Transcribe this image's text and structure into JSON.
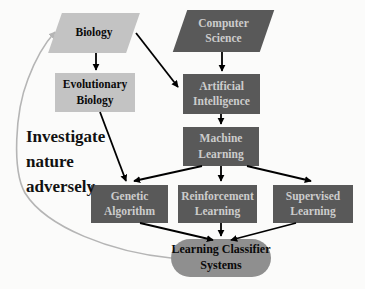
{
  "figure": {
    "type": "flowchart",
    "background": "#fbfbfa",
    "colors": {
      "light_node_fill": "#c3c3c3",
      "dark_node_fill": "#595959",
      "oval_node_fill": "#8f8f8f",
      "dark_node_text": "#cccccc",
      "light_node_text": "#0a0a0a",
      "arrow": "#000000",
      "feedback_arrow": "#b5b5b5"
    },
    "nodes": [
      {
        "id": "biology",
        "label": "Biology",
        "shape": "parallelogram",
        "variant": "light"
      },
      {
        "id": "computer-science",
        "label": "Computer Science",
        "shape": "parallelogram",
        "variant": "dark"
      },
      {
        "id": "evolutionary-biology",
        "label": "Evolutionary Biology",
        "shape": "rect",
        "variant": "light"
      },
      {
        "id": "artificial-intelligence",
        "label": "Artificial Intelligence",
        "shape": "rect",
        "variant": "dark"
      },
      {
        "id": "machine-learning",
        "label": "Machine Learning",
        "shape": "rect",
        "variant": "dark"
      },
      {
        "id": "genetic-algorithm",
        "label": "Genetic Algorithm",
        "shape": "rect",
        "variant": "dark"
      },
      {
        "id": "reinforcement-learning",
        "label": "Reinforcement Learning",
        "shape": "rect",
        "variant": "dark"
      },
      {
        "id": "supervised-learning",
        "label": "Supervised Learning",
        "shape": "rect",
        "variant": "dark"
      },
      {
        "id": "learning-classifier-systems",
        "label": "Learning Classifier Systems",
        "shape": "stadium",
        "variant": "oval"
      }
    ],
    "annotation": {
      "label": "Investigate nature adversely"
    },
    "edges": [
      {
        "from": "biology",
        "to": "evolutionary-biology",
        "style": "solid-black"
      },
      {
        "from": "biology",
        "to": "artificial-intelligence",
        "style": "solid-black"
      },
      {
        "from": "computer-science",
        "to": "artificial-intelligence",
        "style": "solid-black"
      },
      {
        "from": "artificial-intelligence",
        "to": "machine-learning",
        "style": "solid-black"
      },
      {
        "from": "evolutionary-biology",
        "to": "genetic-algorithm",
        "style": "solid-black"
      },
      {
        "from": "machine-learning",
        "to": "genetic-algorithm",
        "style": "solid-black"
      },
      {
        "from": "machine-learning",
        "to": "reinforcement-learning",
        "style": "solid-black"
      },
      {
        "from": "machine-learning",
        "to": "supervised-learning",
        "style": "solid-black"
      },
      {
        "from": "genetic-algorithm",
        "to": "learning-classifier-systems",
        "style": "solid-black"
      },
      {
        "from": "reinforcement-learning",
        "to": "learning-classifier-systems",
        "style": "solid-black"
      },
      {
        "from": "supervised-learning",
        "to": "learning-classifier-systems",
        "style": "solid-black"
      },
      {
        "from": "learning-classifier-systems",
        "to": "biology",
        "style": "curved-gray"
      }
    ]
  }
}
